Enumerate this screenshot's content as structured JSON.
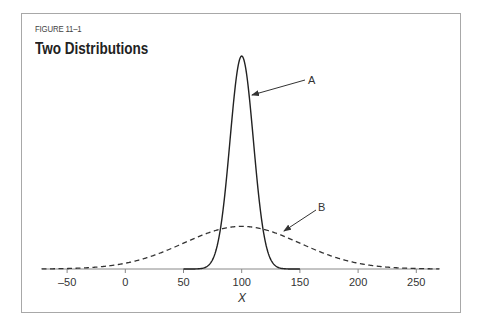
{
  "figure": {
    "label": "FIGURE 11–1",
    "title": "Two Distributions"
  },
  "colors": {
    "frame": "#a8a8a8",
    "curve": "#333333",
    "axis": "#888888"
  },
  "chart_data": {
    "type": "line",
    "title": "Two Distributions",
    "subtitle": "FIGURE 11–1",
    "xlabel": "X",
    "ylabel": "",
    "xlim": [
      -72,
      270
    ],
    "xticks": [
      -50,
      0,
      50,
      100,
      150,
      200,
      250
    ],
    "xtick_labels": [
      "–50",
      "0",
      "50",
      "100",
      "150",
      "200",
      "250"
    ],
    "grid": false,
    "legend": "none (curves labeled A and B via arrows)",
    "series": [
      {
        "name": "A",
        "style": "solid",
        "distribution": "normal",
        "mean": 100,
        "sd": 10,
        "relative_peak_height": 1.0,
        "x_range": [
          50,
          150
        ]
      },
      {
        "name": "B",
        "style": "dashed",
        "distribution": "normal",
        "mean": 100,
        "sd": 50,
        "relative_peak_height": 0.2,
        "x_range": [
          -72,
          270
        ]
      }
    ],
    "annotations": [
      {
        "text": "A",
        "points_to": "solid curve right flank near x≈108"
      },
      {
        "text": "B",
        "points_to": "dashed curve right flank near x≈135"
      }
    ]
  }
}
